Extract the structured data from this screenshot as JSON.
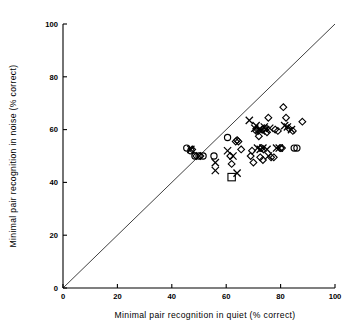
{
  "chart_data": {
    "type": "scatter",
    "title": "",
    "xlabel": "Minimal pair recognition in quiet (% correct)",
    "ylabel": "Minimal pair recognition in noise (% correct)",
    "xlim": [
      0,
      100
    ],
    "ylim": [
      0,
      100
    ],
    "xticks": [
      0,
      20,
      40,
      60,
      80,
      100
    ],
    "yticks": [
      0,
      20,
      40,
      60,
      80,
      100
    ],
    "xtick_labels": [
      "0",
      "20",
      "40",
      "60",
      "80",
      "100"
    ],
    "ytick_labels": [
      "0",
      "20",
      "40",
      "60",
      "80",
      "100"
    ],
    "grid": false,
    "legend": "none",
    "annotations": [
      {
        "name": "identity-line",
        "description": "diagonal reference line of equality y = x",
        "from": [
          0,
          0
        ],
        "to": [
          100,
          100
        ]
      }
    ],
    "series": [
      {
        "name": "circle-markers",
        "marker": "circle",
        "points": [
          [
            45.5,
            53.0
          ],
          [
            47.0,
            52.0
          ],
          [
            48.5,
            50.0
          ],
          [
            50.0,
            50.0
          ],
          [
            51.5,
            50.0
          ],
          [
            55.5,
            50.0
          ],
          [
            60.5,
            57.0
          ],
          [
            85.0,
            53.0
          ],
          [
            86.0,
            53.0
          ]
        ]
      },
      {
        "name": "cross-markers",
        "marker": "cross",
        "points": [
          [
            47.0,
            52.5
          ],
          [
            56.0,
            47.5
          ],
          [
            56.0,
            44.5
          ],
          [
            60.5,
            52.0
          ],
          [
            62.5,
            50.0
          ],
          [
            64.0,
            43.5
          ],
          [
            68.5,
            63.5
          ],
          [
            70.5,
            60.5
          ],
          [
            71.0,
            61.5
          ],
          [
            71.5,
            53.0
          ],
          [
            72.0,
            60.0
          ],
          [
            72.5,
            52.5
          ],
          [
            73.0,
            59.5
          ],
          [
            73.5,
            53.0
          ],
          [
            74.0,
            61.0
          ],
          [
            74.5,
            60.0
          ],
          [
            75.0,
            52.5
          ],
          [
            75.5,
            50.0
          ],
          [
            76.0,
            60.5
          ],
          [
            78.5,
            53.0
          ],
          [
            79.5,
            53.0
          ],
          [
            81.5,
            61.5
          ],
          [
            82.5,
            61.0
          ],
          [
            84.0,
            60.0
          ]
        ]
      },
      {
        "name": "diamond-markers",
        "marker": "diamond",
        "points": [
          [
            47.5,
            52.5
          ],
          [
            49.0,
            50.0
          ],
          [
            50.5,
            50.0
          ],
          [
            61.5,
            50.0
          ],
          [
            63.5,
            55.5
          ],
          [
            64.0,
            56.0
          ],
          [
            64.5,
            55.5
          ],
          [
            62.0,
            47.0
          ],
          [
            65.5,
            52.5
          ],
          [
            69.0,
            50.0
          ],
          [
            69.5,
            52.0
          ],
          [
            70.0,
            47.5
          ],
          [
            71.0,
            59.5
          ],
          [
            71.5,
            60.0
          ],
          [
            72.0,
            57.5
          ],
          [
            72.5,
            49.5
          ],
          [
            73.0,
            53.0
          ],
          [
            73.5,
            48.5
          ],
          [
            74.0,
            60.5
          ],
          [
            75.0,
            59.0
          ],
          [
            75.5,
            64.5
          ],
          [
            76.5,
            49.5
          ],
          [
            77.5,
            49.5
          ],
          [
            78.0,
            60.0
          ],
          [
            79.0,
            59.5
          ],
          [
            80.0,
            53.0
          ],
          [
            80.5,
            53.0
          ],
          [
            81.0,
            68.5
          ],
          [
            82.0,
            64.5
          ],
          [
            83.0,
            60.5
          ],
          [
            84.5,
            59.5
          ],
          [
            88.0,
            63.0
          ]
        ]
      },
      {
        "name": "square-markers",
        "marker": "square",
        "points": [
          [
            62.0,
            42.0
          ]
        ]
      }
    ]
  },
  "axes": {
    "x_axis_name": "x-axis",
    "y_axis_name": "y-axis"
  }
}
